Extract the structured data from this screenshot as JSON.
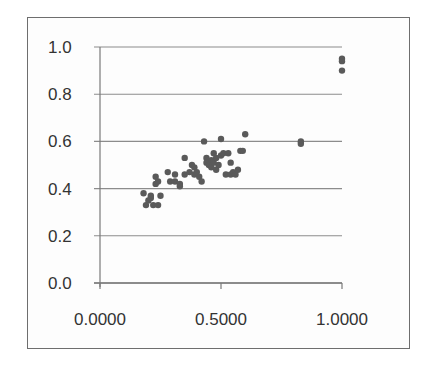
{
  "chart_data": {
    "type": "scatter",
    "title": "",
    "xlabel": "",
    "ylabel": "",
    "xlim": [
      0,
      1
    ],
    "ylim": [
      0,
      1
    ],
    "grid": {
      "y_major": true,
      "x_major": false
    },
    "legend": null,
    "x_ticks": [
      "0.0000",
      "0.5000",
      "1.0000"
    ],
    "y_ticks": [
      "0.0",
      "0.2",
      "0.4",
      "0.6",
      "0.8",
      "1.0"
    ],
    "series": [
      {
        "name": "",
        "color": "#5a5a5a",
        "points": [
          [
            0.18,
            0.38
          ],
          [
            0.19,
            0.33
          ],
          [
            0.2,
            0.35
          ],
          [
            0.21,
            0.36
          ],
          [
            0.22,
            0.33
          ],
          [
            0.21,
            0.37
          ],
          [
            0.23,
            0.45
          ],
          [
            0.23,
            0.42
          ],
          [
            0.24,
            0.43
          ],
          [
            0.24,
            0.33
          ],
          [
            0.25,
            0.37
          ],
          [
            0.28,
            0.47
          ],
          [
            0.29,
            0.43
          ],
          [
            0.31,
            0.46
          ],
          [
            0.31,
            0.43
          ],
          [
            0.33,
            0.41
          ],
          [
            0.33,
            0.42
          ],
          [
            0.35,
            0.53
          ],
          [
            0.35,
            0.46
          ],
          [
            0.37,
            0.47
          ],
          [
            0.38,
            0.5
          ],
          [
            0.39,
            0.49
          ],
          [
            0.39,
            0.46
          ],
          [
            0.4,
            0.47
          ],
          [
            0.41,
            0.45
          ],
          [
            0.42,
            0.43
          ],
          [
            0.43,
            0.6
          ],
          [
            0.44,
            0.53
          ],
          [
            0.44,
            0.51
          ],
          [
            0.45,
            0.5
          ],
          [
            0.46,
            0.52
          ],
          [
            0.46,
            0.49
          ],
          [
            0.47,
            0.55
          ],
          [
            0.47,
            0.51
          ],
          [
            0.48,
            0.48
          ],
          [
            0.48,
            0.53
          ],
          [
            0.49,
            0.5
          ],
          [
            0.5,
            0.61
          ],
          [
            0.5,
            0.54
          ],
          [
            0.51,
            0.55
          ],
          [
            0.52,
            0.46
          ],
          [
            0.53,
            0.55
          ],
          [
            0.54,
            0.51
          ],
          [
            0.54,
            0.46
          ],
          [
            0.55,
            0.47
          ],
          [
            0.56,
            0.46
          ],
          [
            0.57,
            0.48
          ],
          [
            0.58,
            0.56
          ],
          [
            0.59,
            0.56
          ],
          [
            0.6,
            0.63
          ],
          [
            0.83,
            0.6
          ],
          [
            0.83,
            0.59
          ],
          [
            1.0,
            0.95
          ],
          [
            1.0,
            0.94
          ],
          [
            1.0,
            0.9
          ]
        ]
      }
    ]
  },
  "plot": {
    "left": 100,
    "right": 342,
    "top": 47,
    "bottom": 283,
    "gridline_color": "#8c8c8c",
    "axis_color": "#7a7a7a",
    "marker_color": "#5a5a5a",
    "marker_radius": 3.2
  }
}
